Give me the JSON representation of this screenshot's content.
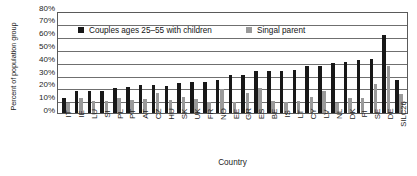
{
  "chart_data": {
    "type": "bar",
    "title": "",
    "xlabel": "Country",
    "ylabel": "Percent of population group",
    "ylim": [
      0,
      80
    ],
    "ytick_labels": [
      "80%",
      "70%",
      "60%",
      "50%",
      "40%",
      "30%",
      "20%",
      "10%",
      "0%"
    ],
    "ytick_values": [
      80,
      70,
      60,
      50,
      40,
      30,
      20,
      10,
      0
    ],
    "grid": true,
    "legend_position": "upper-left-inside",
    "categories": [
      "IT",
      "IE",
      "LU",
      "SI",
      "PL",
      "PT",
      "AT",
      "CZ",
      "HU",
      "SK",
      "UK",
      "FR",
      "NO",
      "EE",
      "GR",
      "ES",
      "BE",
      "IS",
      "LT",
      "CY",
      "LV",
      "NL",
      "DK",
      "FI",
      "SE",
      "DE",
      "SILC26"
    ],
    "series": [
      {
        "name": "Couples ages 25–55 with children",
        "color": "#181818",
        "values": [
          11.5,
          17,
          17,
          17.5,
          19.5,
          20,
          21.5,
          21.5,
          21,
          23.5,
          24,
          24,
          26,
          29.5,
          30,
          32.5,
          33,
          33,
          33.5,
          36.5,
          37,
          39,
          39.5,
          41,
          42,
          61,
          25.5
        ]
      },
      {
        "name": "Singal parent",
        "color": "#9a9a9a",
        "values": [
          8,
          12,
          9.5,
          9,
          12,
          10.5,
          11,
          16,
          10,
          12.5,
          11,
          8.5,
          18.5,
          8.5,
          16,
          19.5,
          9,
          8.5,
          9.5,
          12.5,
          17,
          8,
          11.5,
          12,
          23,
          37,
          14.5
        ]
      }
    ]
  },
  "legend": {
    "items": [
      {
        "label": "Couples ages 25–55 with children",
        "color": "#181818"
      },
      {
        "label": "Singal parent",
        "color": "#9a9a9a"
      }
    ]
  }
}
